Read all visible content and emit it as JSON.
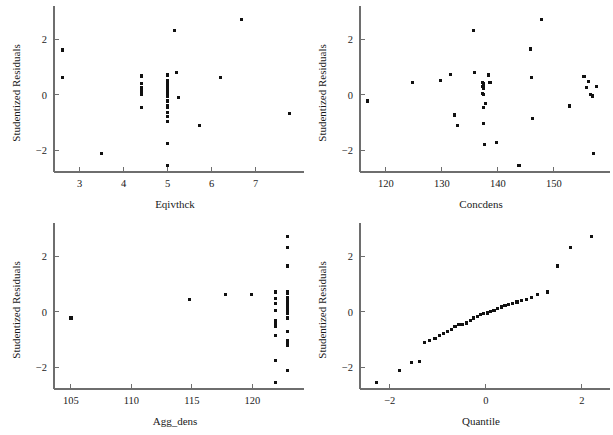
{
  "figure": {
    "kind": "scatterplot-matrix-of-residuals",
    "panel_count": 4,
    "marker_color": "#111111",
    "axis_color": "#6e6e6e",
    "background": "#ffffff"
  },
  "chart_data": [
    {
      "id": "eqivthck",
      "type": "scatter",
      "title": "",
      "xlabel": "Eqivthck",
      "ylabel": "Studentized Residuals",
      "xlim": [
        2.42,
        7.92
      ],
      "ylim": [
        -2.78,
        2.92
      ],
      "xticks": [
        3,
        4,
        5,
        6,
        7
      ],
      "xticklabels": [
        "3",
        "4",
        "5",
        "6",
        "7"
      ],
      "yticks": [
        -2,
        0,
        2
      ],
      "yticklabels": [
        "−2",
        "0",
        "2"
      ],
      "grid": false,
      "legend": null,
      "x": [
        2.62,
        2.62,
        3.5,
        4.4,
        4.4,
        4.4,
        4.4,
        4.4,
        4.4,
        4.4,
        5.0,
        5.0,
        5.0,
        5.0,
        5.0,
        5.0,
        5.0,
        5.0,
        5.0,
        5.0,
        5.0,
        5.0,
        5.0,
        5.0,
        5.0,
        5.0,
        5.0,
        5.0,
        5.0,
        5.15,
        5.2,
        5.25,
        5.72,
        6.2,
        6.68,
        7.78
      ],
      "y": [
        1.62,
        0.62,
        -2.12,
        0.68,
        0.42,
        0.28,
        0.18,
        0.05,
        0.02,
        -0.45,
        0.72,
        0.52,
        0.44,
        0.38,
        0.3,
        0.24,
        0.18,
        0.12,
        0.06,
        0.02,
        -0.05,
        -0.22,
        -0.38,
        -0.46,
        -0.62,
        -0.78,
        -0.95,
        -1.75,
        -2.55,
        2.32,
        0.8,
        -0.1,
        -1.1,
        0.64,
        2.72,
        -0.68
      ]
    },
    {
      "id": "concdens",
      "type": "scatter",
      "title": "",
      "xlabel": "Concdens",
      "ylabel": "Studentized Residuals",
      "xlim": [
        115.4,
        158.6
      ],
      "ylim": [
        -2.78,
        2.92
      ],
      "xticks": [
        120,
        130,
        140,
        150
      ],
      "xticklabels": [
        "120",
        "130",
        "140",
        "150"
      ],
      "yticks": [
        -2,
        0,
        2
      ],
      "yticklabels": [
        "−2",
        "0",
        "2"
      ],
      "grid": false,
      "legend": null,
      "x": [
        116.8,
        124.8,
        129.8,
        131.6,
        132.3,
        132.3,
        132.8,
        135.6,
        135.8,
        137.2,
        137.2,
        137.2,
        137.4,
        137.4,
        137.4,
        137.4,
        137.4,
        137.5,
        137.6,
        137.8,
        138.4,
        138.6,
        139.8,
        143.8,
        145.8,
        146.0,
        146.2,
        147.8,
        152.8,
        155.4,
        155.8,
        156.2,
        156.6,
        156.9,
        157.1,
        157.6
      ],
      "y": [
        -0.22,
        0.46,
        0.52,
        0.74,
        -0.7,
        -0.74,
        -1.1,
        2.32,
        0.8,
        0.46,
        0.3,
        0.06,
        0.42,
        0.36,
        0.24,
        0.02,
        -0.44,
        -1.02,
        -1.78,
        -0.3,
        0.72,
        0.44,
        -1.72,
        -2.55,
        1.66,
        0.62,
        -0.86,
        2.72,
        -0.4,
        0.66,
        0.26,
        0.48,
        0.02,
        -0.04,
        -2.1,
        0.3
      ]
    },
    {
      "id": "agg_dens",
      "type": "scatter",
      "title": "",
      "xlabel": "Agg_dens",
      "ylabel": "Studentized Residuals",
      "xlim": [
        103.6,
        123.6
      ],
      "ylim": [
        -2.78,
        2.92
      ],
      "xticks": [
        105,
        110,
        115,
        120
      ],
      "xticklabels": [
        "105",
        "110",
        "115",
        "120"
      ],
      "yticks": [
        -2,
        0,
        2
      ],
      "yticklabels": [
        "−2",
        "0",
        "2"
      ],
      "grid": false,
      "legend": null,
      "x": [
        105.0,
        114.8,
        117.8,
        119.9,
        121.9,
        121.9,
        121.9,
        121.9,
        121.9,
        121.9,
        121.9,
        121.9,
        121.9,
        121.9,
        122.9,
        122.9,
        122.9,
        122.9,
        122.9,
        122.9,
        122.9,
        122.9,
        122.9,
        122.9,
        122.9,
        122.9,
        122.9,
        122.9,
        122.9,
        122.9,
        122.9,
        122.9,
        122.9,
        122.9,
        122.9,
        122.9
      ],
      "y": [
        -0.22,
        0.46,
        0.62,
        0.62,
        0.72,
        0.48,
        0.06,
        -0.4,
        -0.52,
        -0.86,
        -1.75,
        -2.55,
        0.3,
        -0.3,
        2.72,
        2.32,
        1.66,
        0.74,
        0.66,
        0.52,
        0.44,
        0.42,
        0.36,
        0.3,
        0.26,
        0.18,
        0.12,
        0.06,
        0.02,
        -0.04,
        -0.22,
        -0.7,
        -1.02,
        -1.1,
        -1.2,
        -2.1
      ]
    },
    {
      "id": "quantile",
      "type": "scatter",
      "title": "",
      "xlabel": "Quantile",
      "ylabel": "Studentized Residuals",
      "xlim": [
        -2.62,
        2.42
      ],
      "ylim": [
        -2.78,
        2.92
      ],
      "xticks": [
        -2,
        0,
        2
      ],
      "xticklabels": [
        "−2",
        "0",
        "2"
      ],
      "yticks": [
        -2,
        0,
        2
      ],
      "yticklabels": [
        "−2",
        "0",
        "2"
      ],
      "grid": false,
      "legend": null,
      "x": [
        -2.28,
        -1.8,
        -1.55,
        -1.38,
        -1.28,
        -1.18,
        -1.06,
        -0.96,
        -0.88,
        -0.8,
        -0.72,
        -0.64,
        -0.56,
        -0.48,
        -0.4,
        -0.32,
        -0.25,
        -0.18,
        -0.11,
        -0.04,
        0.03,
        0.1,
        0.17,
        0.25,
        0.32,
        0.4,
        0.48,
        0.56,
        0.65,
        0.74,
        0.84,
        0.95,
        1.08,
        1.28,
        1.5,
        1.76,
        2.2
      ],
      "y": [
        -2.55,
        -2.12,
        -1.82,
        -1.78,
        -1.1,
        -1.04,
        -0.95,
        -0.86,
        -0.78,
        -0.7,
        -0.62,
        -0.52,
        -0.46,
        -0.44,
        -0.4,
        -0.3,
        -0.22,
        -0.15,
        -0.1,
        -0.06,
        -0.04,
        0.02,
        0.06,
        0.12,
        0.18,
        0.24,
        0.26,
        0.3,
        0.36,
        0.42,
        0.46,
        0.52,
        0.62,
        0.72,
        1.66,
        2.32,
        2.72
      ]
    }
  ]
}
